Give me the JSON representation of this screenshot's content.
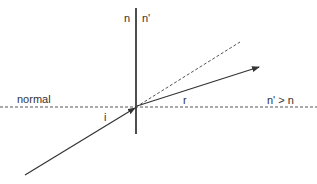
{
  "diagram": {
    "colors": {
      "line": "#333333",
      "dashed": "#555555",
      "background": "#ffffff"
    },
    "labels": {
      "medium_left": "n",
      "medium_right": "n'",
      "normal": "normal",
      "incident_angle": "i",
      "refraction_angle": "r",
      "condition": "n' > n"
    },
    "elements": {
      "interface": "vertical boundary between media n and n'",
      "normal_line": "dashed horizontal normal",
      "incident_ray": "solid arrow toward interface",
      "refracted_ray": "solid arrow away from interface",
      "undeviated_extension": "dashed continuation of incident ray"
    }
  }
}
